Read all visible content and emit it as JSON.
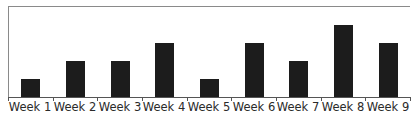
{
  "chart_data": {
    "type": "bar",
    "title": "",
    "xlabel": "",
    "ylabel": "",
    "categories": [
      "Week 1",
      "Week 2",
      "Week 3",
      "Week 4",
      "Week 5",
      "Week 6",
      "Week 7",
      "Week 8",
      "Week 9"
    ],
    "values": [
      1,
      2,
      2,
      3,
      1,
      3,
      2,
      4,
      3
    ],
    "ylim": [
      0,
      5
    ],
    "grid": false,
    "legend": null,
    "bar_color": "#1c1c1c",
    "y_tick_labels_visible": false
  }
}
